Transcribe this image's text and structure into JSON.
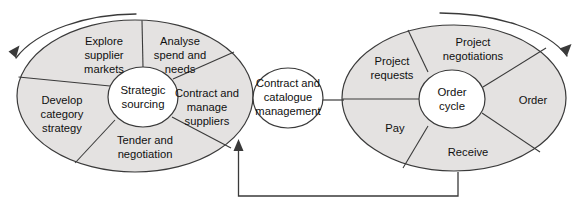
{
  "diagram": {
    "colors": {
      "wedge_fill": "#e4e2e1",
      "hub_fill": "#ffffff",
      "stroke": "#3a3a3a",
      "text": "#101010",
      "background": "#ffffff"
    },
    "left_wheel": {
      "hub_label_line1": "Strategic",
      "hub_label_line2": "sourcing",
      "segments": [
        {
          "id": "explore-supplier-markets",
          "lines": [
            "Explore",
            "supplier",
            "markets"
          ]
        },
        {
          "id": "analyse-spend-and-needs",
          "lines": [
            "Analyse",
            "spend and",
            "needs"
          ]
        },
        {
          "id": "contract-and-manage-suppliers",
          "lines": [
            "Contract and",
            "manage",
            "suppliers"
          ]
        },
        {
          "id": "tender-and-negotiation",
          "lines": [
            "Tender and",
            "negotiation"
          ]
        },
        {
          "id": "develop-category-strategy",
          "lines": [
            "Develop",
            "category",
            "strategy"
          ]
        }
      ]
    },
    "center_node": {
      "lines": [
        "Contract and",
        "catalogue",
        "management"
      ]
    },
    "right_wheel": {
      "hub_label_line1": "Order",
      "hub_label_line2": "cycle",
      "segments": [
        {
          "id": "project-requests",
          "lines": [
            "Project",
            "requests"
          ]
        },
        {
          "id": "project-negotiations",
          "lines": [
            "Project",
            "negotiations"
          ]
        },
        {
          "id": "order",
          "lines": [
            "Order"
          ]
        },
        {
          "id": "receive",
          "lines": [
            "Receive"
          ]
        },
        {
          "id": "pay",
          "lines": [
            "Pay"
          ]
        }
      ]
    },
    "arrows": {
      "left_cycle_arrow": "counter-clockwise-arc-arrow",
      "right_cycle_arrow": "clockwise-arc-arrow",
      "feedback_arrow": "feedback-loop-arrow"
    }
  }
}
